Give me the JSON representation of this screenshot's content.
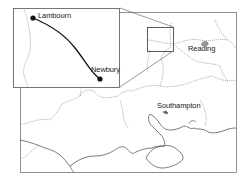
{
  "map": {
    "region": "Southern England",
    "places": [
      {
        "name": "Reading",
        "x": 203,
        "y": 50
      },
      {
        "name": "Southampton",
        "x": 157,
        "y": 107
      }
    ],
    "inset": {
      "route": {
        "start": {
          "name": "Lambourn"
        },
        "end": {
          "name": "Newbury"
        }
      }
    },
    "colors": {
      "coast": "#444444",
      "boundary": "#888888",
      "route": "#111111",
      "frame": "#555555"
    }
  }
}
